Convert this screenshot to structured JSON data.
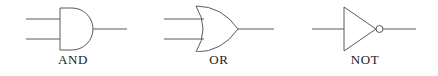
{
  "diagram": {
    "background_color": "#ffffff",
    "stroke_color": "#5a5a5a",
    "label_color": "#1a1a1a",
    "stroke_width": 1,
    "gates": [
      {
        "id": "and",
        "label": "AND",
        "symbol_name": "and-gate-symbol",
        "shape": "d-shape-flat-back-round-front",
        "input_count": 2,
        "output_count": 1,
        "has_inversion_bubble": false
      },
      {
        "id": "or",
        "label": "OR",
        "symbol_name": "or-gate-symbol",
        "shape": "curved-back-pointed-front",
        "input_count": 2,
        "output_count": 1,
        "has_inversion_bubble": false
      },
      {
        "id": "not",
        "label": "NOT",
        "symbol_name": "not-gate-symbol",
        "shape": "triangle-with-bubble",
        "input_count": 1,
        "output_count": 1,
        "has_inversion_bubble": true
      }
    ]
  }
}
